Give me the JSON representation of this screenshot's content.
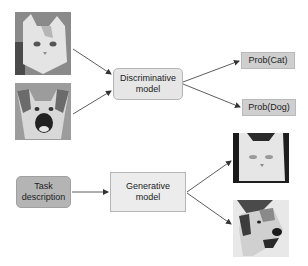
{
  "diagram": {
    "discriminative": {
      "inputs": [
        {
          "name": "cat-photo",
          "label": "cat"
        },
        {
          "name": "dog-photo",
          "label": "dog"
        }
      ],
      "model_label_line1": "Discriminative",
      "model_label_line2": "model",
      "outputs": [
        {
          "label": "Prob(Cat)"
        },
        {
          "label": "Prob(Dog)"
        }
      ]
    },
    "generative": {
      "input_label_line1": "Task",
      "input_label_line2": "description",
      "model_label_line1": "Generative",
      "model_label_line2": "model",
      "outputs": [
        {
          "name": "generated-cat-photo",
          "label": "cat"
        },
        {
          "name": "generated-dog-photo",
          "label": "dog"
        }
      ]
    },
    "colors": {
      "model_box_fill": "#e6e6e6",
      "task_box_fill": "#b4b4b4",
      "prob_box_fill": "#cfcfcf",
      "arrow": "#333333"
    }
  }
}
